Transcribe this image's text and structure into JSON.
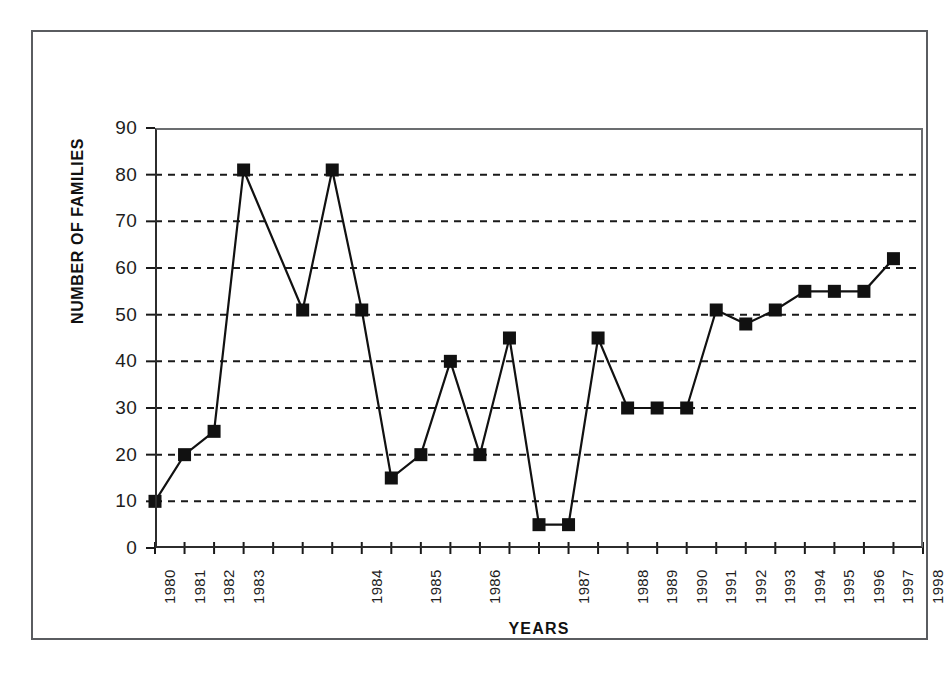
{
  "chart_data": {
    "type": "line",
    "title": "",
    "xlabel": "YEARS",
    "ylabel": "NUMBER OF FAMILIES",
    "ylim": [
      0,
      90
    ],
    "ytick_step": 10,
    "yticks": [
      0,
      10,
      20,
      30,
      40,
      50,
      60,
      70,
      80,
      90
    ],
    "grid": "horizontal-dashed",
    "legend": "none",
    "marker": "filled-square",
    "line_color": "#111111",
    "marker_color": "#111111",
    "x_index_range": [
      0,
      26
    ],
    "x_tick_count": 27,
    "xticks": [
      {
        "index": 0,
        "label": "1980"
      },
      {
        "index": 1,
        "label": "1981"
      },
      {
        "index": 2,
        "label": "1982"
      },
      {
        "index": 3,
        "label": "1983"
      },
      {
        "index": 4,
        "label": ""
      },
      {
        "index": 5,
        "label": ""
      },
      {
        "index": 6,
        "label": ""
      },
      {
        "index": 7,
        "label": "1984"
      },
      {
        "index": 8,
        "label": ""
      },
      {
        "index": 9,
        "label": "1985"
      },
      {
        "index": 10,
        "label": ""
      },
      {
        "index": 11,
        "label": "1986"
      },
      {
        "index": 12,
        "label": ""
      },
      {
        "index": 13,
        "label": ""
      },
      {
        "index": 14,
        "label": "1987"
      },
      {
        "index": 15,
        "label": ""
      },
      {
        "index": 16,
        "label": "1988"
      },
      {
        "index": 17,
        "label": "1989"
      },
      {
        "index": 18,
        "label": "1990"
      },
      {
        "index": 19,
        "label": "1991"
      },
      {
        "index": 20,
        "label": "1992"
      },
      {
        "index": 21,
        "label": "1993"
      },
      {
        "index": 22,
        "label": "1994"
      },
      {
        "index": 23,
        "label": "1995"
      },
      {
        "index": 24,
        "label": "1996"
      },
      {
        "index": 25,
        "label": "1997"
      },
      {
        "index": 26,
        "label": "1998"
      }
    ],
    "x": [
      0,
      1,
      2,
      3,
      5,
      6,
      7,
      8,
      9,
      10,
      11,
      12,
      13,
      14,
      15,
      16,
      17,
      18,
      19,
      20,
      21,
      22,
      23,
      24,
      25
    ],
    "values": [
      10,
      20,
      25,
      81,
      51,
      81,
      51,
      15,
      20,
      40,
      20,
      45,
      5,
      5,
      45,
      30,
      30,
      30,
      51,
      48,
      51,
      55,
      55,
      55,
      62
    ],
    "points": [
      {
        "index": 0,
        "value": 10
      },
      {
        "index": 1,
        "value": 20
      },
      {
        "index": 2,
        "value": 25
      },
      {
        "index": 3,
        "value": 81
      },
      {
        "index": 5,
        "value": 51
      },
      {
        "index": 6,
        "value": 81
      },
      {
        "index": 7,
        "value": 51
      },
      {
        "index": 8,
        "value": 15
      },
      {
        "index": 9,
        "value": 20
      },
      {
        "index": 10,
        "value": 40
      },
      {
        "index": 11,
        "value": 20
      },
      {
        "index": 12,
        "value": 45
      },
      {
        "index": 13,
        "value": 5
      },
      {
        "index": 14,
        "value": 5
      },
      {
        "index": 15,
        "value": 45
      },
      {
        "index": 16,
        "value": 30
      },
      {
        "index": 17,
        "value": 30
      },
      {
        "index": 18,
        "value": 30
      },
      {
        "index": 19,
        "value": 51
      },
      {
        "index": 20,
        "value": 48
      },
      {
        "index": 21,
        "value": 51
      },
      {
        "index": 22,
        "value": 55
      },
      {
        "index": 23,
        "value": 55
      },
      {
        "index": 24,
        "value": 55
      },
      {
        "index": 25,
        "value": 62
      }
    ]
  }
}
